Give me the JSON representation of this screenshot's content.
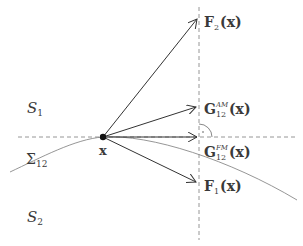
{
  "colors": {
    "vector": "#333333",
    "curve": "#8a8a8a",
    "dashed": "#8a8a8a",
    "text": "#3a3a3a",
    "point": "#111111"
  },
  "point": {
    "label": "x",
    "cx": 103,
    "cy": 137
  },
  "regions": {
    "s1": {
      "base": "S",
      "sub": "1"
    },
    "s2": {
      "base": "S",
      "sub": "2"
    },
    "sigma": {
      "base": "Σ",
      "sub": "12"
    }
  },
  "vectors": [
    {
      "id": "F2",
      "base": "F",
      "sub": "2",
      "sup": "",
      "arg": "(x)",
      "tip": [
        197,
        18
      ]
    },
    {
      "id": "G12AM",
      "base": "G",
      "sub": "12",
      "sup": "AM",
      "arg": "(x)",
      "tip": [
        197,
        107
      ]
    },
    {
      "id": "G12FM",
      "base": "G",
      "sub": "12",
      "sup": "FM",
      "arg": "(x)",
      "tip": [
        197,
        137
      ]
    },
    {
      "id": "F1",
      "base": "F",
      "sub": "1",
      "sup": "",
      "arg": "(x)",
      "tip": [
        197,
        182
      ]
    }
  ],
  "guides": {
    "vertical_x": 199,
    "horizontal_y": 137
  }
}
